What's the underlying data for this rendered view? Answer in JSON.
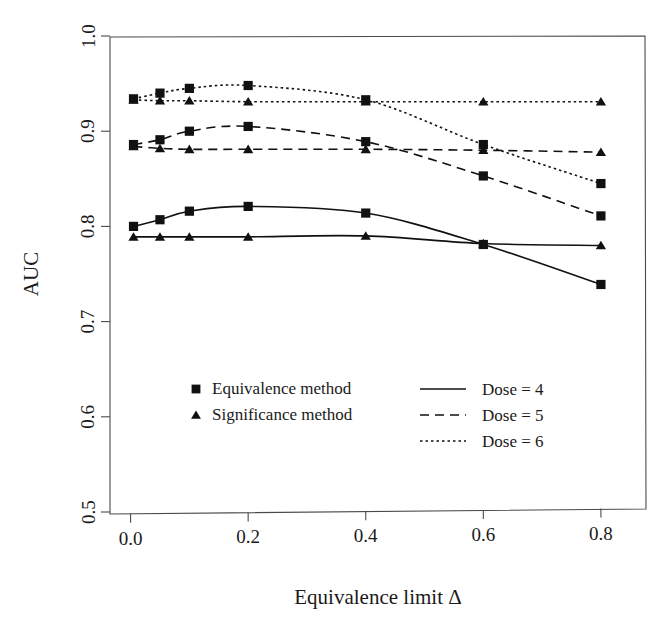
{
  "chart_data": {
    "type": "line",
    "title": "",
    "xlabel": "Equivalence limit Δ",
    "ylabel": "AUC",
    "xlim": [
      -0.035,
      0.875
    ],
    "ylim": [
      0.5,
      1.0
    ],
    "grid": false,
    "legend_position": "center",
    "xticks": [
      "0.0",
      "0.2",
      "0.4",
      "0.6",
      "0.8"
    ],
    "xtick_values": [
      0.0,
      0.2,
      0.4,
      0.6,
      0.8
    ],
    "yticks": [
      "0.5",
      "0.6",
      "0.7",
      "0.8",
      "0.9",
      "1.0"
    ],
    "ytick_values": [
      0.5,
      0.6,
      0.7,
      0.8,
      0.9,
      1.0
    ],
    "x": [
      0.005,
      0.05,
      0.1,
      0.2,
      0.4,
      0.6,
      0.8
    ],
    "series": [
      {
        "name": "Dose = 4, Equivalence method",
        "dose": "4",
        "method": "Equivalence method",
        "marker": "square",
        "linestyle": "solid",
        "values": [
          0.8,
          0.807,
          0.816,
          0.821,
          0.814,
          0.781,
          0.739
        ]
      },
      {
        "name": "Dose = 4, Significance method",
        "dose": "4",
        "method": "Significance method",
        "marker": "triangle",
        "linestyle": "solid",
        "values": [
          0.789,
          0.789,
          0.789,
          0.789,
          0.79,
          0.782,
          0.78
        ]
      },
      {
        "name": "Dose = 5, Equivalence method",
        "dose": "5",
        "method": "Equivalence method",
        "marker": "square",
        "linestyle": "dashed",
        "values": [
          0.886,
          0.891,
          0.9,
          0.905,
          0.889,
          0.853,
          0.811
        ]
      },
      {
        "name": "Dose = 5, Significance method",
        "dose": "5",
        "method": "Significance method",
        "marker": "triangle",
        "linestyle": "dashed",
        "values": [
          0.884,
          0.882,
          0.881,
          0.881,
          0.881,
          0.88,
          0.878
        ]
      },
      {
        "name": "Dose = 6, Equivalence method",
        "dose": "6",
        "method": "Equivalence method",
        "marker": "square",
        "linestyle": "dotted",
        "values": [
          0.934,
          0.94,
          0.945,
          0.948,
          0.933,
          0.886,
          0.845
        ]
      },
      {
        "name": "Dose = 6, Significance method",
        "dose": "6",
        "method": "Significance method",
        "marker": "triangle",
        "linestyle": "dotted",
        "values": [
          0.933,
          0.932,
          0.932,
          0.931,
          0.931,
          0.931,
          0.931
        ]
      }
    ],
    "legend": {
      "marker_entries": [
        {
          "label": "Equivalence method",
          "marker": "square"
        },
        {
          "label": "Significance method",
          "marker": "triangle"
        }
      ],
      "line_entries": [
        {
          "label": "Dose = 4",
          "linestyle": "solid"
        },
        {
          "label": "Dose = 5",
          "linestyle": "dashed"
        },
        {
          "label": "Dose = 6",
          "linestyle": "dotted"
        }
      ]
    },
    "colors": {
      "line": "#111111",
      "marker": "#111111",
      "axis": "#4a4a4a",
      "background": "#ffffff"
    }
  }
}
